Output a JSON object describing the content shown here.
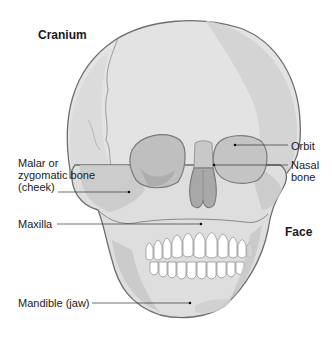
{
  "diagram": {
    "regions": [
      {
        "id": "cranium",
        "label": "Cranium"
      },
      {
        "id": "face",
        "label": "Face"
      }
    ],
    "labels": {
      "orbit": "Orbit",
      "nasal_bone": "Nasal\nbone",
      "malar": "Malar or\nzygomatic bone\n(cheek)",
      "maxilla": "Maxilla",
      "mandible": "Mandible (jaw)"
    },
    "colors": {
      "bone_light": "#e6e6e6",
      "bone_mid": "#d2d2d2",
      "bone_shadow": "#b8b8b8",
      "outline": "#6e6e6e",
      "teeth": "#ffffff",
      "leader_line": "#333333",
      "text": "#1a1a1a"
    }
  }
}
